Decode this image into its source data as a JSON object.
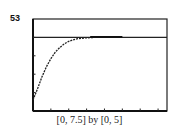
{
  "figure": {
    "label": "53",
    "caption": "[0, 7.5] by [0, 5]"
  },
  "chart_data": {
    "type": "line",
    "title": "",
    "xlabel": "",
    "ylabel": "",
    "xlim": [
      0,
      7.5
    ],
    "ylim": [
      0,
      5
    ],
    "x_ticks": [
      0,
      1,
      2,
      3,
      4,
      5,
      6,
      7
    ],
    "y_ticks": [
      0,
      1,
      2,
      3,
      4,
      5
    ],
    "grid": false,
    "series": [
      {
        "name": "curve",
        "style": "dotted",
        "x": [
          0,
          0.25,
          0.5,
          0.75,
          1.0,
          1.25,
          1.5,
          1.75,
          2.0,
          2.25,
          2.5,
          3.0,
          3.5,
          4.0,
          5.0
        ],
        "y": [
          0.6,
          1.2,
          1.85,
          2.4,
          2.85,
          3.2,
          3.45,
          3.65,
          3.78,
          3.87,
          3.93,
          3.98,
          4.0,
          4.0,
          4.0
        ]
      },
      {
        "name": "horizontal asymptote",
        "style": "solid",
        "x": [
          0,
          7.5
        ],
        "y": [
          4,
          4
        ]
      }
    ]
  }
}
